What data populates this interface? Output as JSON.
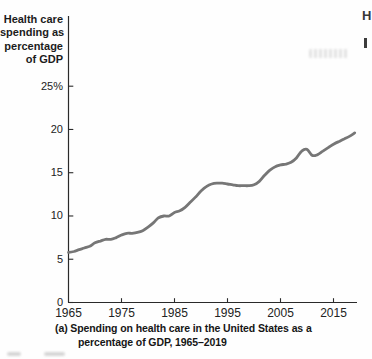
{
  "figure": {
    "y_axis_title_lines": [
      "Health care",
      "spending as",
      "percentage",
      "of GDP"
    ],
    "caption_line1": "(a) Spending on health care in the United States as a",
    "caption_line2": "percentage of GDP, 1965–2019"
  },
  "chart_data": {
    "type": "line",
    "ylabel": "Health care spending as percentage of GDP",
    "xlabel": "",
    "legend": "none",
    "grid": false,
    "line_color": "#767676",
    "axis_color": "#2a2a2a",
    "xlim": [
      1965,
      2019
    ],
    "ylim": [
      0,
      25
    ],
    "x_ticks": [
      1965,
      1975,
      1985,
      1995,
      2005,
      2015
    ],
    "x_tick_labels": [
      "1965",
      "1975",
      "1985",
      "1995",
      "2005",
      "2015"
    ],
    "y_ticks": [
      0,
      5,
      10,
      15,
      20,
      25
    ],
    "y_tick_labels": [
      "0",
      "5",
      "10",
      "15",
      "20",
      "25%"
    ],
    "x": [
      1965,
      1966,
      1967,
      1968,
      1969,
      1970,
      1971,
      1972,
      1973,
      1974,
      1975,
      1976,
      1977,
      1978,
      1979,
      1980,
      1981,
      1982,
      1983,
      1984,
      1985,
      1986,
      1987,
      1988,
      1989,
      1990,
      1991,
      1992,
      1993,
      1994,
      1995,
      1996,
      1997,
      1998,
      1999,
      2000,
      2001,
      2002,
      2003,
      2004,
      2005,
      2006,
      2007,
      2008,
      2009,
      2010,
      2011,
      2012,
      2013,
      2014,
      2015,
      2016,
      2017,
      2018,
      2019
    ],
    "series": [
      {
        "name": "U.S. health care spending as percentage of GDP",
        "values": [
          5.8,
          5.9,
          6.1,
          6.3,
          6.5,
          6.9,
          7.1,
          7.3,
          7.3,
          7.5,
          7.8,
          8.0,
          8.0,
          8.1,
          8.3,
          8.7,
          9.2,
          9.8,
          10.0,
          10.0,
          10.4,
          10.6,
          11.0,
          11.6,
          12.2,
          12.9,
          13.4,
          13.7,
          13.8,
          13.8,
          13.7,
          13.6,
          13.5,
          13.5,
          13.5,
          13.6,
          14.0,
          14.7,
          15.3,
          15.7,
          15.9,
          16.0,
          16.2,
          16.7,
          17.5,
          17.7,
          17.0,
          17.1,
          17.5,
          17.9,
          18.3,
          18.6,
          18.9,
          19.2,
          19.6
        ]
      }
    ]
  },
  "artifacts": {
    "right_edge_letter": "H"
  }
}
